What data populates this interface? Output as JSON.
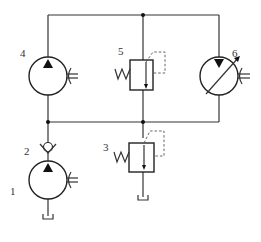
{
  "diagram": {
    "type": "hydraulic-circuit",
    "colors": {
      "line": "#333333",
      "background": "#ffffff"
    },
    "components": [
      {
        "id": "1",
        "label": "1",
        "kind": "fixed-displacement-pump"
      },
      {
        "id": "2",
        "label": "2",
        "kind": "check-valve"
      },
      {
        "id": "3",
        "label": "3",
        "kind": "relief-valve"
      },
      {
        "id": "4",
        "label": "4",
        "kind": "fixed-displacement-pump-motor"
      },
      {
        "id": "5",
        "label": "5",
        "kind": "relief-valve"
      },
      {
        "id": "6",
        "label": "6",
        "kind": "variable-displacement-pump-motor"
      }
    ],
    "tank_symbols": 2,
    "junction_dots": 3
  }
}
